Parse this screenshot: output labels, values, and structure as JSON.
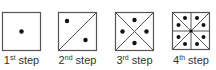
{
  "colors": {
    "stroke": "#555555",
    "dot": "#111111",
    "text": "#333333",
    "background": "#ffffff"
  },
  "steps": [
    {
      "num": "1",
      "suffix": "st",
      "word": "step",
      "dots": 1,
      "lines": "none"
    },
    {
      "num": "2",
      "suffix": "nd",
      "word": "step",
      "dots": 2,
      "lines": "one diagonal"
    },
    {
      "num": "3",
      "suffix": "rd",
      "word": "step",
      "dots": 4,
      "lines": "two diagonals"
    },
    {
      "num": "4",
      "suffix": "th",
      "word": "step",
      "dots": 8,
      "lines": "two diagonals + horizontal + vertical (center dot)"
    }
  ]
}
